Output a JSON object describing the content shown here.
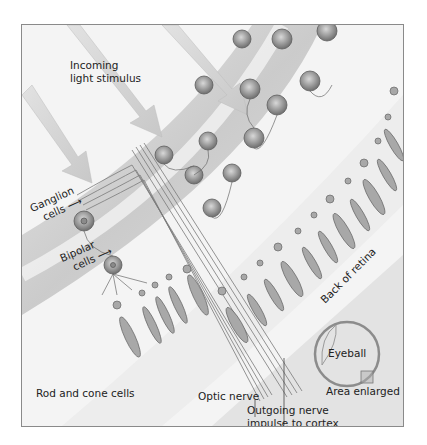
{
  "diagram": {
    "labels": {
      "incoming_light": [
        "Incoming",
        "light stimulus"
      ],
      "ganglion": [
        "Ganglion",
        "cells"
      ],
      "bipolar": [
        "Bipolar",
        "cells"
      ],
      "rod_cone": "Rod and cone cells",
      "optic_nerve": "Optic nerve",
      "outgoing": [
        "Outgoing nerve",
        "impulse to cortex"
      ],
      "back_of_retina": "Back of retina",
      "eyeball": "Eyeball",
      "area_enlarged": "Area enlarged"
    },
    "colors": {
      "cell_fill": "#a9a9a9",
      "cell_dark": "#6e6e6e",
      "band": "#cfcfcf",
      "background": "#f4f4f4",
      "eyeball_ring": "#8c8c8c"
    }
  }
}
